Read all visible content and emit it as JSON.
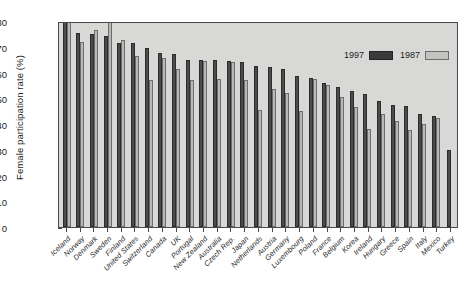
{
  "chart_data": {
    "type": "bar",
    "title": "",
    "xlabel": "",
    "ylabel": "Female participation rate (%)",
    "ylim": [
      0,
      80
    ],
    "yticks": [
      80,
      70,
      60,
      50,
      40,
      30,
      20,
      10,
      0
    ],
    "grid": false,
    "legend_position": "top-right",
    "legend": [
      "1997",
      "1987"
    ],
    "categories": [
      "Iceland",
      "Norway",
      "Denmark",
      "Sweden",
      "Finland",
      "United States",
      "Switzerland",
      "Canada",
      "UK",
      "Portugal",
      "New Zealand",
      "Australia",
      "Czech Rep.",
      "Japan",
      "Netherlands",
      "Austria",
      "Germany",
      "Luxembourg",
      "Poland",
      "France",
      "Belgium",
      "Korea",
      "Ireland",
      "Hungary",
      "Greece",
      "Spain",
      "Italy",
      "Mexico",
      "Turkey"
    ],
    "series": [
      {
        "name": "1997",
        "color": "#4c4c4c",
        "values": [
          80,
          75.5,
          75,
          74,
          71.5,
          71.5,
          69.5,
          67.5,
          67,
          65,
          65,
          65,
          64.5,
          64,
          62.5,
          62,
          61.5,
          58.5,
          58,
          56,
          54.5,
          53,
          51.5,
          49,
          47.5,
          47,
          44,
          43,
          30
        ]
      },
      {
        "name": "1987",
        "color": "#b8b8b6",
        "values": [
          80,
          72,
          76.5,
          79.5,
          72.5,
          66.5,
          57,
          65.5,
          61.5,
          57,
          64.5,
          57.5,
          64,
          57,
          45.5,
          53.5,
          52,
          45,
          57.5,
          55,
          50.5,
          46.5,
          38,
          44,
          41,
          37.5,
          40,
          42.5,
          null
        ]
      }
    ]
  },
  "legend": {
    "item_1997": "1997",
    "item_1987": "1987"
  },
  "axis": {
    "y_title": "Female participation rate (%)"
  }
}
